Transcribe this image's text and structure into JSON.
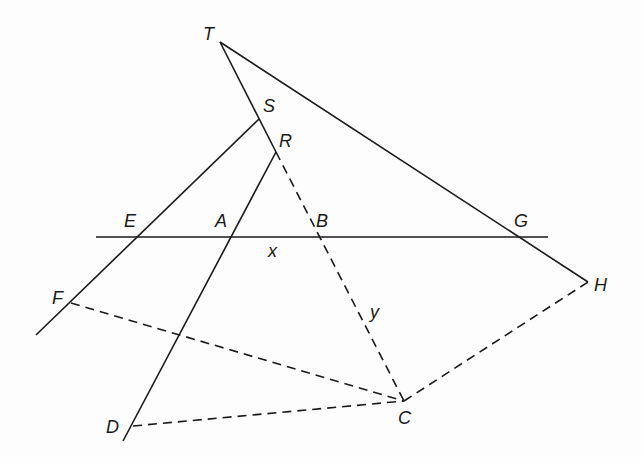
{
  "diagram": {
    "points": {
      "T": {
        "label": "T",
        "x": 220,
        "y": 42,
        "lx": 203,
        "ly": 40
      },
      "S": {
        "label": "S",
        "x": 259,
        "y": 119,
        "lx": 263,
        "ly": 112
      },
      "R": {
        "label": "R",
        "x": 276,
        "y": 152,
        "lx": 279,
        "ly": 147
      },
      "E": {
        "label": "E",
        "x": 138,
        "y": 237,
        "lx": 124,
        "ly": 227
      },
      "A": {
        "label": "A",
        "x": 232,
        "y": 237,
        "lx": 215,
        "ly": 227
      },
      "B": {
        "label": "B",
        "x": 319,
        "y": 237,
        "lx": 316,
        "ly": 227
      },
      "G": {
        "label": "G",
        "x": 519,
        "y": 237,
        "lx": 514,
        "ly": 227
      },
      "H": {
        "label": "H",
        "x": 588,
        "y": 282,
        "lx": 594,
        "ly": 291
      },
      "F": {
        "label": "F",
        "x": 71,
        "y": 303,
        "lx": 52,
        "ly": 304
      },
      "C": {
        "label": "C",
        "x": 404,
        "y": 401,
        "lx": 398,
        "ly": 424
      },
      "D": {
        "label": "D",
        "x": 133,
        "y": 426,
        "lx": 106,
        "ly": 433
      }
    },
    "variables": {
      "x": {
        "label": "x",
        "lx": 268,
        "ly": 257
      },
      "y": {
        "label": "y",
        "lx": 370,
        "ly": 318
      }
    },
    "segments_solid": [
      [
        "T",
        "H"
      ],
      [
        "T",
        "R"
      ],
      [
        "horizontal-line"
      ],
      [
        "S",
        "lower-left"
      ],
      [
        "R",
        "D"
      ]
    ],
    "segments_dashed": [
      [
        "R",
        "C"
      ],
      [
        "F",
        "C"
      ],
      [
        "D",
        "C"
      ],
      [
        "C",
        "H"
      ]
    ]
  }
}
